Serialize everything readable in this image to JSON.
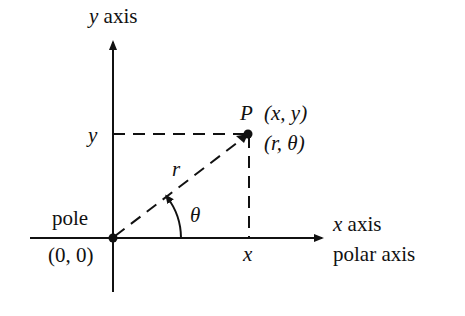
{
  "diagram": {
    "type": "polar-cartesian-coordinates",
    "colors": {
      "ink": "#111111",
      "background": "#ffffff"
    },
    "axes": {
      "y_axis_label_var": "y",
      "y_axis_label_word": "axis",
      "x_axis_label_var": "x",
      "x_axis_label_word": "axis",
      "polar_axis_label": "polar axis"
    },
    "origin": {
      "name": "pole",
      "coords": "(0, 0)"
    },
    "point": {
      "name": "P",
      "cartesian": "(x, y)",
      "polar": "(r, θ)"
    },
    "ticks": {
      "y_tick": "y",
      "x_tick": "x"
    },
    "segment": {
      "radius_label": "r",
      "angle_label": "θ"
    }
  }
}
